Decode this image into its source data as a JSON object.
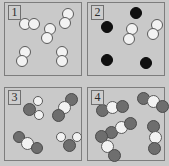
{
  "figure": {
    "type": "particle-diagram",
    "width": 169,
    "height": 166,
    "background_color": "#c9c9c9"
  },
  "legend_colors": {
    "white_atom": "#f2f2f2",
    "black_atom": "#101010",
    "gray_atom": "#6e6e6e",
    "outline": "#5a5a5a",
    "panel_border": "#7d7d7d"
  },
  "panels": [
    {
      "label": "1",
      "box": {
        "x": 4,
        "y": 2,
        "w": 78,
        "h": 74
      },
      "contents_summary": "five diatomic molecules made of two white atoms each",
      "atoms": [
        {
          "cls": "white",
          "x": 19,
          "y": 18,
          "d": 12
        },
        {
          "cls": "white",
          "x": 28,
          "y": 18,
          "d": 12
        },
        {
          "cls": "white",
          "x": 44,
          "y": 23,
          "d": 12
        },
        {
          "cls": "white",
          "x": 41,
          "y": 32,
          "d": 12
        },
        {
          "cls": "white",
          "x": 62,
          "y": 8,
          "d": 12
        },
        {
          "cls": "white",
          "x": 59,
          "y": 17,
          "d": 12
        },
        {
          "cls": "white",
          "x": 19,
          "y": 46,
          "d": 12
        },
        {
          "cls": "white",
          "x": 16,
          "y": 55,
          "d": 12
        },
        {
          "cls": "white",
          "x": 56,
          "y": 46,
          "d": 12
        },
        {
          "cls": "white",
          "x": 56,
          "y": 55,
          "d": 12
        }
      ]
    },
    {
      "label": "2",
      "box": {
        "x": 87,
        "y": 2,
        "w": 78,
        "h": 74
      },
      "contents_summary": "four single black atoms and two diatomic white molecules",
      "atoms": [
        {
          "cls": "black",
          "x": 130,
          "y": 7,
          "d": 12
        },
        {
          "cls": "black",
          "x": 101,
          "y": 21,
          "d": 12
        },
        {
          "cls": "white",
          "x": 126,
          "y": 23,
          "d": 12
        },
        {
          "cls": "white",
          "x": 123,
          "y": 33,
          "d": 12
        },
        {
          "cls": "white",
          "x": 151,
          "y": 19,
          "d": 12
        },
        {
          "cls": "white",
          "x": 147,
          "y": 28,
          "d": 12
        },
        {
          "cls": "black",
          "x": 101,
          "y": 54,
          "d": 12
        },
        {
          "cls": "black",
          "x": 140,
          "y": 57,
          "d": 12
        }
      ]
    },
    {
      "label": "3",
      "box": {
        "x": 4,
        "y": 87,
        "w": 78,
        "h": 74
      },
      "contents_summary": "four molecules each made of one gray atom bonded to two white atoms",
      "atoms": [
        {
          "cls": "gray",
          "x": 23,
          "y": 103,
          "d": 13
        },
        {
          "cls": "white",
          "x": 33,
          "y": 96,
          "d": 10
        },
        {
          "cls": "white",
          "x": 34,
          "y": 110,
          "d": 10
        },
        {
          "cls": "gray",
          "x": 65,
          "y": 93,
          "d": 13
        },
        {
          "cls": "white",
          "x": 58,
          "y": 101,
          "d": 13
        },
        {
          "cls": "gray",
          "x": 52,
          "y": 109,
          "d": 13
        },
        {
          "cls": "gray",
          "x": 13,
          "y": 131,
          "d": 12
        },
        {
          "cls": "white",
          "x": 21,
          "y": 137,
          "d": 13
        },
        {
          "cls": "gray",
          "x": 31,
          "y": 142,
          "d": 12
        },
        {
          "cls": "gray",
          "x": 63,
          "y": 139,
          "d": 13
        },
        {
          "cls": "white",
          "x": 56,
          "y": 132,
          "d": 10
        },
        {
          "cls": "white",
          "x": 72,
          "y": 132,
          "d": 10
        }
      ]
    },
    {
      "label": "4",
      "box": {
        "x": 87,
        "y": 87,
        "w": 78,
        "h": 74
      },
      "contents_summary": "five triatomic molecules each made of gray-white-gray atoms",
      "atoms": [
        {
          "cls": "gray",
          "x": 137,
          "y": 92,
          "d": 13
        },
        {
          "cls": "white",
          "x": 147,
          "y": 95,
          "d": 13
        },
        {
          "cls": "gray",
          "x": 156,
          "y": 100,
          "d": 13
        },
        {
          "cls": "gray",
          "x": 96,
          "y": 104,
          "d": 13
        },
        {
          "cls": "white",
          "x": 106,
          "y": 101,
          "d": 13
        },
        {
          "cls": "gray",
          "x": 116,
          "y": 100,
          "d": 13
        },
        {
          "cls": "gray",
          "x": 105,
          "y": 126,
          "d": 13
        },
        {
          "cls": "white",
          "x": 115,
          "y": 121,
          "d": 13
        },
        {
          "cls": "gray",
          "x": 124,
          "y": 117,
          "d": 13
        },
        {
          "cls": "gray",
          "x": 95,
          "y": 130,
          "d": 13
        },
        {
          "cls": "white",
          "x": 101,
          "y": 140,
          "d": 13
        },
        {
          "cls": "gray",
          "x": 108,
          "y": 149,
          "d": 13
        },
        {
          "cls": "gray",
          "x": 147,
          "y": 120,
          "d": 13
        },
        {
          "cls": "white",
          "x": 149,
          "y": 131,
          "d": 13
        },
        {
          "cls": "gray",
          "x": 148,
          "y": 142,
          "d": 13
        }
      ]
    }
  ]
}
